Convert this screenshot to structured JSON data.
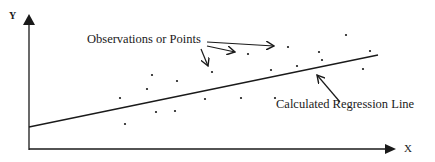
{
  "diagram": {
    "axes": {
      "y_label": "Y",
      "x_label": "X"
    },
    "annotations": {
      "points_label": "Observations or Points",
      "line_label": "Calculated Regression Line"
    },
    "colors": {
      "ink": "#1a1a1a",
      "background": "#ffffff"
    }
  }
}
